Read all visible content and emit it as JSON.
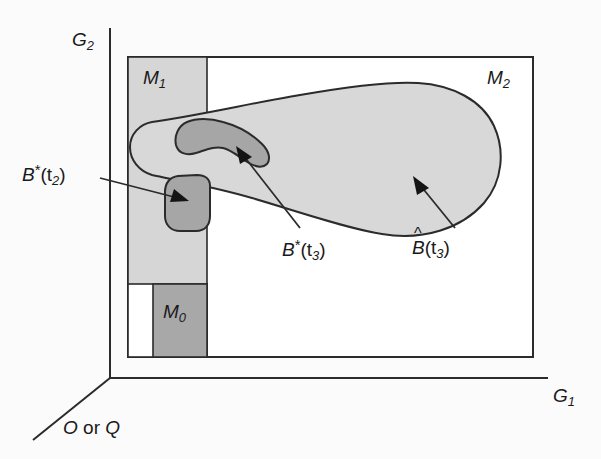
{
  "figure": {
    "type": "schematic-diagram",
    "background": "#fbfbfb"
  },
  "axes": {
    "vertical": {
      "name": "G2",
      "base": "G",
      "sub": "2"
    },
    "horizontal": {
      "name": "G1",
      "base": "G",
      "sub": "1"
    },
    "depth": {
      "name": "O or Q",
      "part_a": "O",
      "conjunction": " or ",
      "part_b": "Q"
    }
  },
  "regions": [
    {
      "id": "M1",
      "base": "M",
      "sub": "1",
      "fill": "#d6d6d6",
      "role": "light-gray vertical strip"
    },
    {
      "id": "M2",
      "base": "M",
      "sub": "2",
      "fill": "#ffffff",
      "role": "outer white frame region"
    },
    {
      "id": "M0",
      "base": "M",
      "sub": "0",
      "fill": "#a8a8a8",
      "role": "dark-gray box at lower left"
    }
  ],
  "annotations": [
    {
      "id": "Bt2",
      "base": "B",
      "mark": "*",
      "arg": "(t",
      "sub": "2",
      "close": ")",
      "target": "small dark blob on strip boundary"
    },
    {
      "id": "Bt3star",
      "base": "B",
      "mark": "*",
      "arg": "(t",
      "sub": "3",
      "close": ")",
      "target": "dark blob inside large light blob"
    },
    {
      "id": "Bt3hat",
      "base": "B",
      "mark": "^",
      "arg": "(t",
      "sub": "3",
      "close": ")",
      "target": "large light-gray blob"
    }
  ],
  "colors": {
    "light_gray": "#d6d6d6",
    "dark_gray": "#a8a8a8",
    "blob_light": "#d8d8d8",
    "blob_dark": "#a6a6a6",
    "stroke": "#2b2b2b",
    "white": "#ffffff"
  }
}
